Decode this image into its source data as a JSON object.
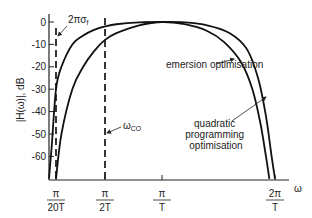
{
  "chart_data": {
    "type": "line",
    "title": "",
    "xlabel": "ω",
    "ylabel": "|H(ω)|, dB",
    "ylim": [
      -70,
      0
    ],
    "yticks": [
      0,
      -10,
      -20,
      -30,
      -40,
      -50,
      -60
    ],
    "ytick_labels": [
      "0",
      "-10",
      "-20",
      "-30",
      "-40",
      "-50",
      "-60"
    ],
    "xticks": [
      {
        "value": 0.05,
        "num": "π",
        "den": "20T"
      },
      {
        "value": 0.5,
        "num": "π",
        "den": "2T"
      },
      {
        "value": 1.0,
        "num": "π",
        "den": "T"
      },
      {
        "value": 2.0,
        "num": "2π",
        "den": "T"
      }
    ],
    "x_units": "π/T",
    "xlim": [
      0,
      2.12
    ],
    "grid": false,
    "series": [
      {
        "name": "quadratic programming optimisation",
        "x": [
          0.0,
          0.02,
          0.05,
          0.1,
          0.2,
          0.3,
          0.4,
          0.5,
          0.6,
          0.8,
          1.0,
          1.2,
          1.4,
          1.6,
          1.75,
          1.85,
          1.92,
          1.97,
          2.0
        ],
        "y": [
          -70,
          -55,
          -30,
          -20,
          -10,
          -6,
          -3.5,
          -2,
          -1,
          -0.2,
          0,
          -0.2,
          -1.5,
          -5,
          -12,
          -25,
          -42,
          -60,
          -70
        ]
      },
      {
        "name": "emersion optimisation",
        "x": [
          0.05,
          0.1,
          0.2,
          0.3,
          0.4,
          0.5,
          0.6,
          0.8,
          1.0,
          1.2,
          1.4,
          1.55,
          1.7,
          1.8,
          1.87,
          1.92,
          1.95
        ],
        "y": [
          -70,
          -50,
          -30,
          -20,
          -13,
          -8,
          -5,
          -1.5,
          0,
          -1,
          -4,
          -9,
          -18,
          -30,
          -45,
          -60,
          -70
        ]
      }
    ],
    "markers": [
      {
        "name": "2πσf",
        "label_main": "2πσ",
        "label_sub": "f",
        "x": 0.05,
        "style": "dashed"
      },
      {
        "name": "ωco",
        "label_main": "ω",
        "label_sub": "CO",
        "x": 0.5,
        "style": "dashed"
      }
    ],
    "annotations": [
      {
        "text": "emersion optimisation",
        "target_series": "emersion optimisation"
      },
      {
        "text_lines": [
          "quadratic",
          "programming",
          "optimisation"
        ],
        "target_series": "quadratic programming optimisation"
      }
    ]
  }
}
